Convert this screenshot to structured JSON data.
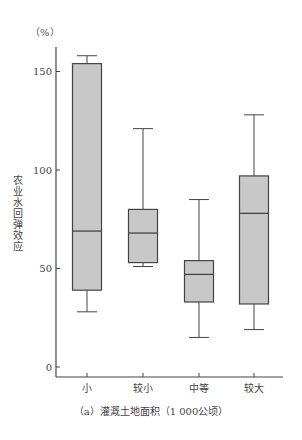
{
  "chart_data": {
    "type": "box",
    "title": "",
    "caption": "（a）灌溉土地面积（1 000公顷）",
    "xlabel": "（a）灌溉土地面积（1 000公顷）",
    "ylabel": "农业水回弹效应",
    "yunit": "（%）",
    "ylim": [
      0,
      160
    ],
    "yticks": [
      0,
      50,
      100,
      150
    ],
    "grid": false,
    "legend": null,
    "categories": [
      "小",
      "较小",
      "中等",
      "较大"
    ],
    "series": [
      {
        "name": "农业水回弹效应",
        "boxes": [
          {
            "category": "小",
            "whisker_low": 28,
            "q1": 39,
            "median": 69,
            "q3": 154,
            "whisker_high": 158
          },
          {
            "category": "较小",
            "whisker_low": 51,
            "q1": 53,
            "median": 68,
            "q3": 80,
            "whisker_high": 121
          },
          {
            "category": "中等",
            "whisker_low": 15,
            "q1": 33,
            "median": 47,
            "q3": 54,
            "whisker_high": 85
          },
          {
            "category": "较大",
            "whisker_low": 19,
            "q1": 32,
            "median": 78,
            "q3": 97,
            "whisker_high": 128
          }
        ]
      }
    ],
    "colors": {
      "box_fill": "#c8c8c8",
      "stroke": "#444444"
    }
  }
}
